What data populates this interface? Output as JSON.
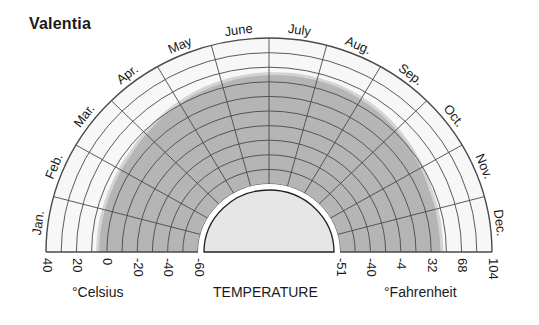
{
  "title": "Valentia",
  "captions": {
    "celsius": "°Celsius",
    "temperature": "TEMPERATURE",
    "fahrenheit": "°Fahrenheit"
  },
  "colors": {
    "background_band": "#f7f7f7",
    "light_range": "#d3d3d3",
    "dark_range": "#b5b5b5",
    "grid": "#4a4a4a",
    "inner_fill": "#e6e6e6"
  },
  "chart_data": {
    "type": "polar-area",
    "title": "Valentia",
    "xlabel": "TEMPERATURE",
    "months": [
      "Jan.",
      "Feb.",
      "Mar.",
      "Apr.",
      "May",
      "June",
      "July",
      "Aug.",
      "Sep.",
      "Oct.",
      "Nov.",
      "Dec."
    ],
    "celsius_ticks": [
      40,
      20,
      0,
      -20,
      -40,
      -60
    ],
    "fahrenheit_ticks": [
      -51,
      -40,
      -4,
      32,
      68,
      104
    ],
    "radial_range_celsius": [
      -60,
      40
    ],
    "ring_step_celsius": 10,
    "series": [
      {
        "name": "Mean temperature range (dark)",
        "values": [
          5,
          5,
          6,
          9,
          12,
          14,
          15,
          15,
          13,
          10,
          7,
          6
        ]
      },
      {
        "name": "Extreme temperature range (light)",
        "values": [
          7,
          7,
          8,
          11,
          14,
          16,
          17,
          17,
          15,
          12,
          9,
          8
        ]
      }
    ],
    "units": [
      "°Celsius",
      "°Fahrenheit"
    ]
  }
}
